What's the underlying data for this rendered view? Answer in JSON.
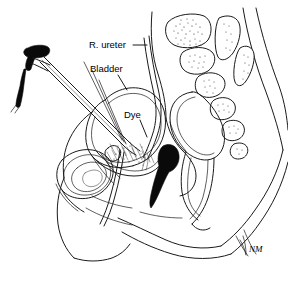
{
  "figure": {
    "type": "medical-line-illustration",
    "view": "sagittal",
    "background_color": "#ffffff",
    "ink_color": "#1a1a1a",
    "width": 288,
    "height": 284
  },
  "labels": [
    {
      "id": "r-ureter",
      "text": "R. ureter",
      "x": 89,
      "y": 48,
      "leader": "horizontal dash to right toward descending ureter"
    },
    {
      "id": "bladder",
      "text": "Bladder",
      "x": 90,
      "y": 72,
      "leader": "short diagonal down-right to bladder dome outline"
    },
    {
      "id": "dye",
      "text": "Dye",
      "x": 124,
      "y": 118,
      "leader": "short diagonal down-right to dye within bladder base"
    }
  ],
  "signature": {
    "text": "NM",
    "x": 249,
    "y": 252
  },
  "structures": [
    {
      "id": "cystoscope",
      "name": "cystoscope",
      "description": "rigid cystoscope with black T-shaped eyepiece head at upper left, angled black light-post arm, long straight shaft entering urethra"
    },
    {
      "id": "bladder",
      "name": "urinary bladder",
      "description": "large rounded dome occupying left-central pelvis, double-line wall"
    },
    {
      "id": "r-ureter",
      "name": "right ureter",
      "description": "narrow double-line tube descending from upper pelvis to bladder trigone"
    },
    {
      "id": "dye",
      "name": "dye",
      "description": "stippled dye pooling at bladder base near trigone"
    },
    {
      "id": "vagina",
      "name": "vagina and cervix",
      "description": "solid black dye-filled canal with bulbous cervical end"
    },
    {
      "id": "uterus",
      "name": "uterus",
      "description": "anteverted organ outline posterior to bladder"
    },
    {
      "id": "rectum",
      "name": "rectum and sigmoid colon",
      "description": "double-walled curved tube posterior to uterus"
    },
    {
      "id": "sacrum",
      "name": "sacrum and lumbar vertebrae",
      "description": "stippled trabecular vertebral bodies with spinous processes upper right"
    },
    {
      "id": "pubic-symphysis",
      "name": "pubic symphysis",
      "description": "concentric oval bone at lower left"
    },
    {
      "id": "body-contour",
      "name": "abdominal and gluteal body contour",
      "description": "long sweeping outline of torso, perineum and thigh"
    }
  ]
}
